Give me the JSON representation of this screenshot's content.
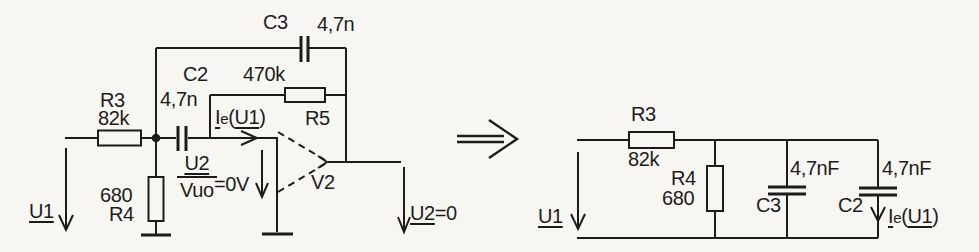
{
  "figure": {
    "ink_color": "#1d1c1a",
    "paper_color": "#f7f6f2"
  },
  "left": {
    "r3_name": "R3",
    "r3_value": "82k",
    "c3_name": "C3",
    "c3_value": "4,7n",
    "c2_name": "C2",
    "c2_value": "4,7n",
    "r5_name": "R5",
    "r5_value": "470k",
    "r4_name": "R4",
    "r4_value": "680",
    "input_voltage": "U1",
    "ie": {
      "sym": "I",
      "sub": "e",
      "open": "(",
      "arg": "U1",
      "close": ")"
    },
    "ratio": {
      "num": "U2",
      "den": "Vuo",
      "eq": "=0V"
    },
    "opamp_name": "V2",
    "output": {
      "sym": "U2",
      "eq": "=0"
    }
  },
  "right": {
    "r3_name": "R3",
    "r3_value": "82k",
    "r4_name": "R4",
    "r4_value": "680",
    "c3_name": "C3",
    "c3_value": "4,7nF",
    "c2_name": "C2",
    "c2_value": "4,7nF",
    "input_voltage": "U1",
    "ie": {
      "sym": "I",
      "sub": "e",
      "open": "(",
      "arg": "U1",
      "close": ")"
    }
  }
}
